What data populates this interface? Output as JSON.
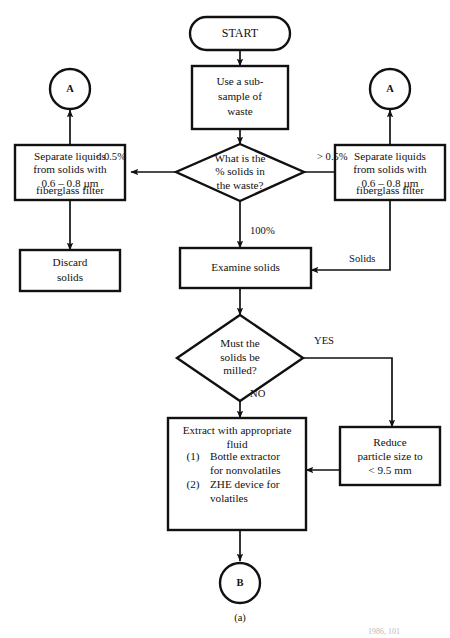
{
  "figure": {
    "caption": "(a)",
    "source_note": "1986, 101",
    "stroke_color": "#111111",
    "background": "#ffffff"
  },
  "nodes": {
    "start": {
      "label": "START",
      "shape": "terminator"
    },
    "subsample": {
      "lines": [
        "Use a sub-",
        "sample of",
        "waste"
      ],
      "shape": "process"
    },
    "connector_left": {
      "label": "A",
      "shape": "connector"
    },
    "connector_right": {
      "label": "A",
      "shape": "connector"
    },
    "separate_left": {
      "lines": [
        "Separate liquids",
        "from solids with",
        "0.6 – 0.8 µm",
        "fiberglass filter"
      ],
      "shape": "process"
    },
    "separate_right": {
      "lines": [
        "Separate liquids",
        "from solids with",
        "0.6 – 0.8 µm",
        "fiberglass filter"
      ],
      "shape": "process"
    },
    "decision_solids": {
      "lines": [
        "What is the",
        "% solids in",
        "the waste?"
      ],
      "shape": "decision"
    },
    "discard": {
      "lines": [
        "Discard",
        "solids"
      ],
      "shape": "process"
    },
    "examine": {
      "lines": [
        "Examine  solids"
      ],
      "shape": "process"
    },
    "decision_milled": {
      "lines": [
        "Must the",
        "solids be",
        "milled?"
      ],
      "shape": "decision"
    },
    "extract": {
      "shape": "process",
      "heading": [
        "Extract with appropriate",
        "fluid"
      ],
      "items": [
        {
          "index": "(1)",
          "lines": [
            "Bottle extractor",
            "for nonvolatiles"
          ]
        },
        {
          "index": "(2)",
          "lines": [
            "ZHE device for",
            "volatiles"
          ]
        }
      ]
    },
    "reduce": {
      "lines": [
        "Reduce",
        "particle size to",
        "< 9.5 mm"
      ],
      "shape": "process"
    },
    "connector_bottom": {
      "label": "B",
      "shape": "connector"
    }
  },
  "edge_labels": {
    "less_than": "< 0.5%",
    "greater_than": "> 0.5%",
    "hundred": "100%",
    "solids": "Solids",
    "yes": "YES",
    "no": "NO"
  }
}
